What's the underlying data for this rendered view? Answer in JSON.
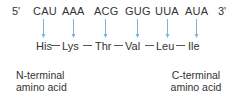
{
  "mrna": {
    "five_prime": "5'",
    "three_prime": "3'",
    "codons": [
      "CAU",
      "AAA",
      "ACG",
      "GUG",
      "UUA",
      "AUA"
    ]
  },
  "peptide": {
    "amino_acids": [
      "His",
      "Lys",
      "Thr",
      "Val",
      "Leu",
      "Ile"
    ],
    "bond": "—"
  },
  "labels": {
    "n_terminal_line1": "N-terminal",
    "n_terminal_line2": "amino acid",
    "c_terminal_line1": "C-terminal",
    "c_terminal_line2": "amino acid"
  },
  "colors": {
    "arrow": "#7fb3d9",
    "text": "#333333"
  }
}
